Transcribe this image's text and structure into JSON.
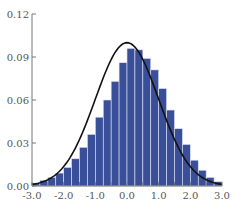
{
  "chart_data": {
    "type": "bar",
    "title": "",
    "xlabel": "",
    "ylabel": "",
    "xlim": [
      -3.0,
      3.0
    ],
    "ylim": [
      0.0,
      0.12
    ],
    "grid": false,
    "legend": null,
    "x_ticks": [
      "-3.0",
      "-2.0",
      "-1.0",
      "0.0",
      "1.0",
      "2.0",
      "3.0"
    ],
    "y_ticks": [
      "0.00",
      "0.03",
      "0.06",
      "0.09",
      "0.12"
    ],
    "bin_width": 0.25,
    "bin_starts": [
      -3.0,
      -2.75,
      -2.5,
      -2.25,
      -2.0,
      -1.75,
      -1.5,
      -1.25,
      -1.0,
      -0.75,
      -0.5,
      -0.25,
      0.0,
      0.25,
      0.5,
      0.75,
      1.0,
      1.25,
      1.5,
      1.75,
      2.0,
      2.25,
      2.5,
      2.75
    ],
    "values": [
      0.002,
      0.004,
      0.006,
      0.009,
      0.013,
      0.019,
      0.027,
      0.036,
      0.048,
      0.06,
      0.073,
      0.086,
      0.096,
      0.095,
      0.089,
      0.081,
      0.068,
      0.053,
      0.04,
      0.029,
      0.018,
      0.011,
      0.006,
      0.003
    ],
    "series": [
      {
        "name": "histogram",
        "type": "bar",
        "color": "#3a4f9a"
      },
      {
        "name": "normal density curve",
        "type": "line",
        "color": "#111111",
        "peak": 0.1
      }
    ]
  }
}
